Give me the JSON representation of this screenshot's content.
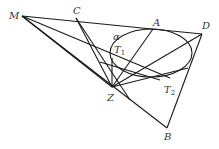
{
  "diagram": {
    "type": "geometry",
    "points": {
      "M": {
        "label": "M",
        "x": 22,
        "y": 16
      },
      "C": {
        "label": "C",
        "x": 76,
        "y": 18
      },
      "A": {
        "label": "A",
        "x": 153,
        "y": 29
      },
      "D": {
        "label": "D",
        "x": 202,
        "y": 34
      },
      "Z": {
        "label": "Z",
        "x": 112,
        "y": 87
      },
      "B": {
        "label": "B",
        "x": 167,
        "y": 128
      }
    },
    "labels": {
      "M": "M",
      "C": "C",
      "A": "A",
      "D": "D",
      "Z": "Z",
      "B": "B",
      "alpha": "α",
      "T1_main": "T",
      "T1_sub": "1",
      "T2_main": "T",
      "T2_sub": "2"
    },
    "ellipse": {
      "label": "α",
      "cx": 151,
      "cy": 53,
      "rx": 41,
      "ry": 24
    },
    "segments": [
      [
        "M",
        "D"
      ],
      [
        "M",
        "Z"
      ],
      [
        "M",
        "B"
      ],
      [
        "M",
        "T2"
      ],
      [
        "C",
        "Z"
      ],
      [
        "C",
        "B"
      ],
      [
        "A",
        "Z"
      ],
      [
        "D",
        "Z"
      ],
      [
        "D",
        "B"
      ],
      [
        "Z",
        "B"
      ],
      [
        "Z",
        "T1"
      ],
      [
        "Z",
        "T2"
      ]
    ],
    "stroke_color": "#1a1a1a"
  }
}
